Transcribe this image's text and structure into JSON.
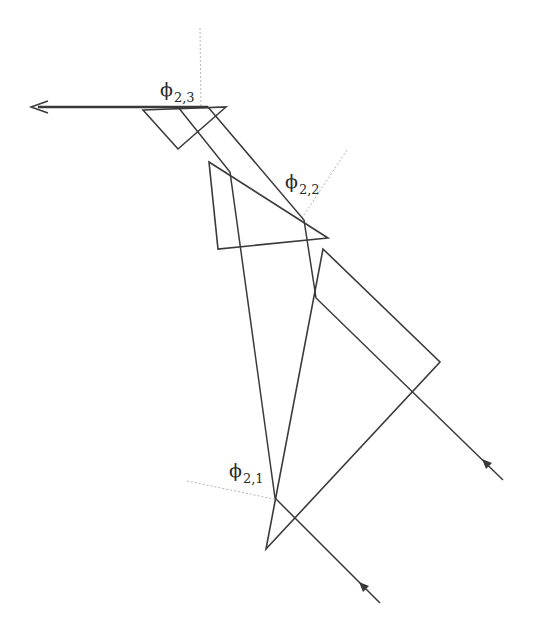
{
  "diagram": {
    "colors": {
      "line": "#3a3a3a",
      "normal": "#b0b0b0",
      "background": "#ffffff"
    },
    "labels": [
      {
        "id": "phi23",
        "symbol": "ϕ",
        "subscript": "2,3"
      },
      {
        "id": "phi22",
        "symbol": "ϕ",
        "subscript": "2,2"
      },
      {
        "id": "phi21",
        "symbol": "ϕ",
        "subscript": "2,1"
      }
    ],
    "prisms": [
      {
        "name": "prism-1",
        "points": "266,549 323,249 440,362"
      },
      {
        "name": "prism-2",
        "points": "209,162 328,238 218,249"
      },
      {
        "name": "prism-3",
        "points": "143,110 226,107 178,149"
      }
    ],
    "beams": [
      {
        "name": "input-beam-1",
        "points": "380,603 275,498 230,172 178,107"
      },
      {
        "name": "input-beam-2",
        "points": "503,480 316,298 304,220 208,107"
      }
    ],
    "output_beam": {
      "from": "208,107",
      "to": "32,107"
    }
  }
}
